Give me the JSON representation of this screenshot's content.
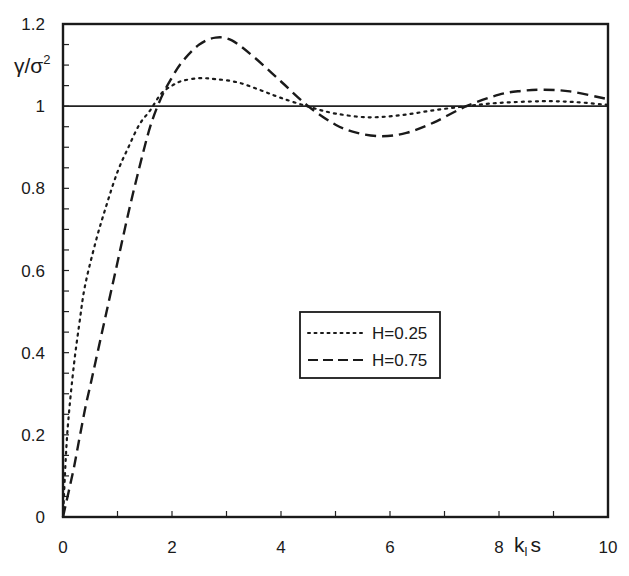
{
  "chart_data": {
    "type": "line",
    "title": "",
    "xlabel": "k_l s",
    "xlabel_main": "k",
    "xlabel_sub": "l",
    "xlabel_tail": "s",
    "ylabel": "γ/σ²",
    "ylabel_main": "γ/σ",
    "ylabel_sup": "2",
    "xlim": [
      0,
      10
    ],
    "ylim": [
      0,
      1.2
    ],
    "xticks": [
      0,
      2,
      4,
      6,
      8,
      10
    ],
    "xtick_labels": [
      "0",
      "2",
      "4",
      "6",
      "8",
      "10"
    ],
    "yticks": [
      0,
      0.2,
      0.4,
      0.6,
      0.8,
      1,
      1.2
    ],
    "ytick_labels": [
      "0",
      "0.2",
      "0.4",
      "0.6",
      "0.8",
      "1",
      "1.2"
    ],
    "grid": false,
    "reference_line": {
      "y": 1,
      "style": "solid"
    },
    "legend_position": "center-right",
    "series": [
      {
        "name": "H=0.25",
        "style": "dotted",
        "x": [
          0,
          0.05,
          0.1,
          0.2,
          0.3,
          0.4,
          0.6,
          0.8,
          1.0,
          1.2,
          1.4,
          1.6,
          1.8,
          2.0,
          2.2,
          2.5,
          2.8,
          3.2,
          3.6,
          4.0,
          4.5,
          5.0,
          5.6,
          6.2,
          6.8,
          7.4,
          8.0,
          8.8,
          9.4,
          10
        ],
        "values": [
          0,
          0.14,
          0.24,
          0.37,
          0.47,
          0.56,
          0.67,
          0.76,
          0.84,
          0.9,
          0.955,
          0.99,
          1.03,
          1.05,
          1.062,
          1.068,
          1.066,
          1.058,
          1.04,
          1.02,
          0.999,
          0.982,
          0.973,
          0.978,
          0.99,
          1.0,
          1.008,
          1.012,
          1.01,
          1.003
        ]
      },
      {
        "name": "H=0.75",
        "style": "dashed",
        "x": [
          0,
          0.1,
          0.2,
          0.3,
          0.4,
          0.5,
          0.6,
          0.8,
          1.0,
          1.2,
          1.4,
          1.6,
          1.8,
          2.0,
          2.2,
          2.5,
          2.8,
          3.1,
          3.5,
          4.0,
          4.5,
          5.0,
          5.4,
          5.85,
          6.3,
          6.8,
          7.4,
          8.0,
          8.4,
          8.8,
          9.3,
          10
        ],
        "values": [
          0,
          0.06,
          0.12,
          0.19,
          0.26,
          0.32,
          0.38,
          0.5,
          0.62,
          0.74,
          0.85,
          0.95,
          1.02,
          1.07,
          1.11,
          1.15,
          1.167,
          1.16,
          1.12,
          1.06,
          1.0,
          0.955,
          0.935,
          0.927,
          0.935,
          0.96,
          1.0,
          1.028,
          1.037,
          1.04,
          1.036,
          1.017
        ]
      }
    ]
  },
  "legend": {
    "items": [
      {
        "label": "H=0.25",
        "style": "dotted"
      },
      {
        "label": "H=0.75",
        "style": "dashed"
      }
    ]
  }
}
